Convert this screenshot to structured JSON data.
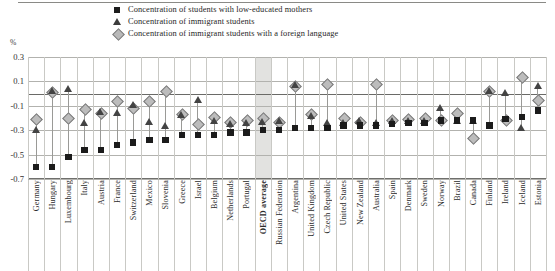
{
  "axis": {
    "unit_label": "%",
    "y_ticks": [
      "0.3",
      "0.1",
      "-0.1",
      "-0.3",
      "-0.5",
      "-0.7"
    ]
  },
  "legend": {
    "items": [
      {
        "marker": "square",
        "label": "Concentration of students with low-educated mothers"
      },
      {
        "marker": "triangle",
        "label": "Concentration of immigrant students"
      },
      {
        "marker": "diamond",
        "label": "Concentration of immigrant students with a foreign language"
      }
    ]
  },
  "chart_data": {
    "type": "scatter",
    "title": "",
    "xlabel": "",
    "ylabel": "%",
    "ylim": [
      -0.7,
      0.3
    ],
    "ytick_values": [
      0.3,
      0.1,
      -0.1,
      -0.3,
      -0.5,
      -0.7
    ],
    "grid": true,
    "legend_position": "top",
    "highlight_category": "OECD average",
    "categories": [
      "Germany",
      "Hungary",
      "Luxembourg",
      "Italy",
      "Austria",
      "France",
      "Switzerland",
      "Mexico",
      "Slovenia",
      "Greece",
      "Israel",
      "Belgium",
      "Netherlands",
      "Portugal",
      "OECD average",
      "Russian Federation",
      "Argentina",
      "United Kingdom",
      "Czech Republic",
      "United States",
      "New Zealand",
      "Australia",
      "Spain",
      "Denmark",
      "Sweden",
      "Norway",
      "Brazil",
      "Canada",
      "Finland",
      "Ireland",
      "Iceland",
      "Estonia"
    ],
    "series": [
      {
        "name": "Concentration of students with low-educated mothers",
        "marker": "square",
        "color": "#1b1b1b",
        "values": [
          -0.6,
          -0.6,
          -0.52,
          -0.46,
          -0.46,
          -0.42,
          -0.4,
          -0.38,
          -0.38,
          -0.34,
          -0.34,
          -0.34,
          -0.32,
          -0.32,
          -0.3,
          -0.3,
          -0.28,
          -0.28,
          -0.28,
          -0.26,
          -0.26,
          -0.26,
          -0.25,
          -0.24,
          -0.24,
          -0.22,
          -0.22,
          -0.22,
          -0.26,
          -0.21,
          -0.19,
          -0.14
        ]
      },
      {
        "name": "Concentration of immigrant students",
        "marker": "triangle",
        "color": "#434343",
        "values": [
          -0.3,
          0.02,
          0.04,
          -0.24,
          -0.15,
          -0.16,
          -0.09,
          -0.23,
          -0.26,
          -0.17,
          -0.05,
          -0.22,
          -0.25,
          -0.24,
          -0.23,
          -0.22,
          0.07,
          -0.18,
          -0.24,
          -0.24,
          -0.22,
          -0.24,
          -0.22,
          -0.22,
          -0.22,
          -0.12,
          -0.22,
          -0.22,
          0.02,
          0.01,
          -0.28,
          0.06
        ]
      },
      {
        "name": "Concentration of immigrant students with a foreign language",
        "marker": "diamond",
        "color": "#bcbcbc",
        "values": [
          -0.21,
          0.01,
          -0.2,
          -0.13,
          -0.16,
          -0.06,
          -0.12,
          -0.06,
          0.02,
          -0.17,
          -0.25,
          -0.19,
          -0.23,
          -0.22,
          -0.2,
          -0.23,
          0.06,
          -0.17,
          0.08,
          -0.2,
          -0.23,
          0.08,
          -0.22,
          -0.21,
          -0.2,
          -0.22,
          -0.16,
          -0.36,
          0.02,
          -0.22,
          0.14,
          -0.05
        ]
      }
    ]
  }
}
